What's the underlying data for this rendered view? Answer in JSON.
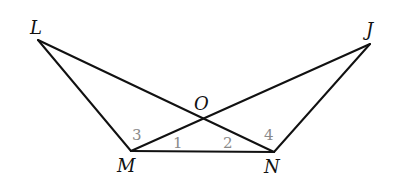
{
  "diagram": {
    "type": "geometry",
    "vertices": {
      "L": {
        "label": "L",
        "x": 38,
        "y": 40,
        "lx": 30,
        "ly": 34
      },
      "J": {
        "label": "J",
        "x": 370,
        "y": 44,
        "lx": 366,
        "ly": 36
      },
      "M": {
        "label": "M",
        "x": 131,
        "y": 151,
        "lx": 117,
        "ly": 172
      },
      "N": {
        "label": "N",
        "x": 274,
        "y": 152,
        "lx": 264,
        "ly": 173
      },
      "O": {
        "label": "O",
        "x": 203,
        "y": 118,
        "lx": 194,
        "ly": 110
      }
    },
    "segments": [
      {
        "id": "LM",
        "from": "L",
        "to": "M"
      },
      {
        "id": "LN",
        "from": "L",
        "to": "N"
      },
      {
        "id": "JM",
        "from": "J",
        "to": "M"
      },
      {
        "id": "JN",
        "from": "J",
        "to": "N"
      },
      {
        "id": "MN",
        "from": "M",
        "to": "N"
      }
    ],
    "angle_labels": [
      {
        "label": "3",
        "x": 132,
        "y": 140
      },
      {
        "label": "1",
        "x": 173,
        "y": 148
      },
      {
        "label": "2",
        "x": 223,
        "y": 148
      },
      {
        "label": "4",
        "x": 264,
        "y": 140
      }
    ],
    "colors": {
      "line": "#111111",
      "vertex_label": "#111111",
      "angle_label": "#8a8a8a",
      "background": "#ffffff"
    }
  }
}
